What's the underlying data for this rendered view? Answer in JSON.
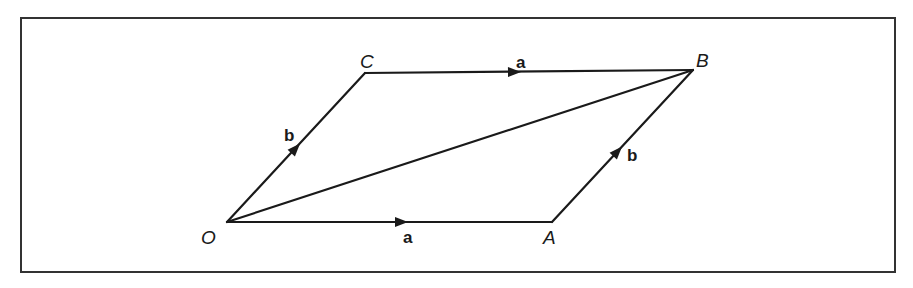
{
  "figure": {
    "title": "",
    "colors": {
      "line": "#1a1a1a",
      "border": "#333333",
      "background": "#ffffff"
    },
    "border": {
      "x": 21,
      "y": 18,
      "width": 874,
      "height": 254
    },
    "vertices": {
      "O": {
        "label": "O",
        "x": 227,
        "y": 222,
        "label_x": 202,
        "label_y": 243
      },
      "A": {
        "label": "A",
        "x": 552,
        "y": 222,
        "label_x": 543,
        "label_y": 243
      },
      "B": {
        "label": "B",
        "x": 693,
        "y": 70,
        "label_x": 696,
        "label_y": 67
      },
      "C": {
        "label": "C",
        "x": 365,
        "y": 73,
        "label_x": 360,
        "label_y": 68
      }
    },
    "edges": [
      {
        "id": "OA",
        "from": "O",
        "to": "A",
        "vector": "a",
        "label": "a",
        "arrow": {
          "x": 400,
          "y": 222
        },
        "label_pos": {
          "x": 403,
          "y": 242
        }
      },
      {
        "id": "CB",
        "from": "C",
        "to": "B",
        "vector": "a",
        "label": "a",
        "arrow": {
          "x": 513,
          "y": 72
        },
        "label_pos": {
          "x": 516,
          "y": 68
        }
      },
      {
        "id": "OC",
        "from": "O",
        "to": "C",
        "vector": "b",
        "label": "b",
        "arrow": {
          "x": 296,
          "y": 148
        },
        "label_pos": {
          "x": 284,
          "y": 140
        }
      },
      {
        "id": "AB",
        "from": "A",
        "to": "B",
        "vector": "b",
        "label": "b",
        "arrow": {
          "x": 617,
          "y": 155
        },
        "label_pos": {
          "x": 627,
          "y": 161
        }
      },
      {
        "id": "OB",
        "from": "O",
        "to": "B",
        "vector": "",
        "label": "",
        "arrow": null
      }
    ],
    "labels": {
      "O": "O",
      "A": "A",
      "B": "B",
      "C": "C",
      "a_bottom": "a",
      "a_top": "a",
      "b_left": "b",
      "b_right": "b"
    }
  }
}
